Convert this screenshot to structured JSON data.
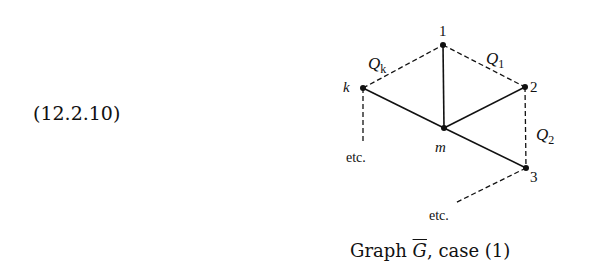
{
  "equation_number": "(12.2.10)",
  "graph": {
    "nodes": [
      {
        "id": "1",
        "label": "1",
        "x": 443,
        "y": 45,
        "italic": false
      },
      {
        "id": "2",
        "label": "2",
        "x": 525,
        "y": 87,
        "italic": false
      },
      {
        "id": "3",
        "label": "3",
        "x": 526,
        "y": 168,
        "italic": false
      },
      {
        "id": "k",
        "label": "k",
        "x": 363,
        "y": 88,
        "italic": true
      },
      {
        "id": "m",
        "label": "m",
        "x": 444,
        "y": 128,
        "italic": true
      }
    ],
    "edges": [
      {
        "from": "1",
        "to": "m",
        "style": "solid"
      },
      {
        "from": "k",
        "to": "m",
        "style": "solid"
      },
      {
        "from": "m",
        "to": "2",
        "style": "solid"
      },
      {
        "from": "m",
        "to": "3",
        "style": "solid"
      },
      {
        "from": "k",
        "to": "1",
        "style": "dashed",
        "label": "Q_k"
      },
      {
        "from": "1",
        "to": "2",
        "style": "dashed",
        "label": "Q_1"
      },
      {
        "from": "2",
        "to": "3",
        "style": "dashed",
        "label": "Q_2"
      },
      {
        "from": "k",
        "to": "etc-left",
        "style": "dashed"
      },
      {
        "from": "3",
        "to": "etc-bottom",
        "style": "dashed"
      }
    ],
    "edge_labels": {
      "qk": {
        "main": "Q",
        "sub": "k"
      },
      "q1": {
        "main": "Q",
        "sub": "1"
      },
      "q2": {
        "main": "Q",
        "sub": "2"
      }
    },
    "continuations": {
      "left": "etc.",
      "bottom": "etc."
    }
  },
  "caption": {
    "prefix": "Graph ",
    "symbol": "G",
    "suffix": ", case (1)"
  }
}
